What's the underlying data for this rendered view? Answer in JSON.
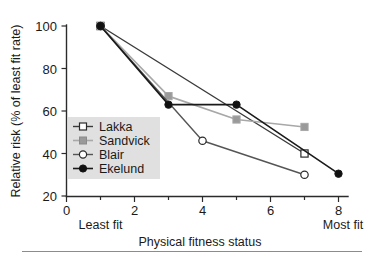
{
  "chart_data": {
    "type": "line",
    "title": "",
    "xlabel": "Physical fitness status",
    "ylabel": "Relative risk (% of least fit rate)",
    "xlim": [
      0,
      8.35
    ],
    "ylim": [
      20,
      103
    ],
    "grid": false,
    "legend_position": "center-left inside axes",
    "x_ticks": [
      0,
      1,
      2,
      3,
      4,
      5,
      6,
      7,
      8
    ],
    "x_ticklabels": [
      "0",
      "",
      "2",
      "",
      "4",
      "",
      "6",
      "",
      "8"
    ],
    "y_ticks": [
      20,
      40,
      60,
      80,
      100
    ],
    "y_ticklabels": [
      "20",
      "40",
      "60",
      "80",
      "100"
    ],
    "annotations": [
      {
        "text": "Least fit",
        "x": 1,
        "position": "below-axis"
      },
      {
        "text": "Most fit",
        "x": 8,
        "position": "below-axis"
      }
    ],
    "series": [
      {
        "name": "Lakka",
        "color": "#3a3a3a",
        "marker": "open-square",
        "marker_fill": "#ffffff",
        "x": [
          1,
          7
        ],
        "y": [
          100,
          40
        ]
      },
      {
        "name": "Sandvick",
        "color": "#a8a8a8",
        "marker": "filled-square",
        "marker_fill": "#9a9a9a",
        "x": [
          1,
          3,
          5,
          7
        ],
        "y": [
          100,
          67,
          56,
          52.5
        ]
      },
      {
        "name": "Blair",
        "color": "#555555",
        "marker": "open-circle",
        "marker_fill": "#ffffff",
        "x": [
          1,
          4,
          7
        ],
        "y": [
          100,
          46,
          30
        ]
      },
      {
        "name": "Ekelund",
        "color": "#1a1a1a",
        "marker": "filled-circle",
        "marker_fill": "#111111",
        "x": [
          1,
          3,
          5,
          8
        ],
        "y": [
          100,
          63,
          63,
          30.5
        ]
      }
    ]
  },
  "legend": {
    "background": "#e0e0e0",
    "entries": [
      {
        "label": "Lakka"
      },
      {
        "label": "Sandvick"
      },
      {
        "label": "Blair"
      },
      {
        "label": "Ekelund"
      }
    ]
  }
}
